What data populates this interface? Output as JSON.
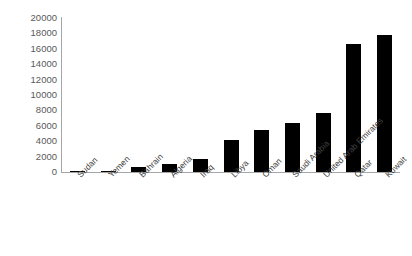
{
  "chart_data": {
    "type": "bar",
    "title": "",
    "subtitle": "",
    "xlabel": "",
    "ylabel": "",
    "categories": [
      "Sudan",
      "Yemen",
      "Bahrain",
      "Algeria",
      "Iraq",
      "Libya",
      "Oman",
      "Saudi Arabia",
      "United Arab Emirates",
      "Qatar",
      "Kuwait"
    ],
    "values": [
      100,
      150,
      700,
      1100,
      1700,
      4200,
      5400,
      6400,
      7600,
      16600,
      17800
    ],
    "ylim": [
      0,
      20000
    ],
    "yticks": [
      0,
      2000,
      4000,
      6000,
      8000,
      10000,
      12000,
      14000,
      16000,
      18000,
      20000
    ],
    "ytick_labels": [
      "0",
      "2000",
      "4000",
      "6000",
      "8000",
      "10000",
      "12000",
      "14000",
      "16000",
      "18000",
      "20000"
    ],
    "grid": false,
    "legend": false,
    "legend_position": "none",
    "bar_color": "#000000",
    "axis_color": "#a6a6a6",
    "tick_label_color": "#595959",
    "category_label_color": "#404040",
    "background_color": "#ffffff",
    "category_label_rotation": -45
  }
}
